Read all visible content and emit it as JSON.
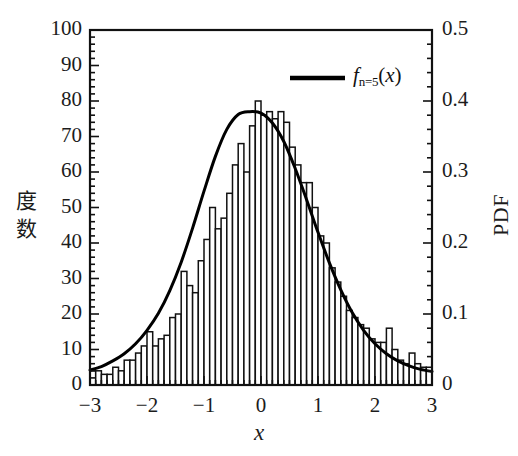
{
  "chart_data": {
    "type": "bar",
    "title": "",
    "subtitle": "",
    "xlabel": "x",
    "ylabel": "度 数",
    "ylabel_right": "PDF",
    "xlim": [
      -3,
      3
    ],
    "ylim": [
      0,
      100
    ],
    "ylim_right": [
      0,
      0.5
    ],
    "grid": false,
    "legend_position": "top-right",
    "xticks": [
      "−3",
      "−2",
      "−1",
      "0",
      "1",
      "2",
      "3"
    ],
    "xtick_values": [
      -3,
      -2,
      -1,
      0,
      1,
      2,
      3
    ],
    "yticks_left": [
      "0",
      "10",
      "20",
      "30",
      "40",
      "50",
      "60",
      "70",
      "80",
      "90",
      "100"
    ],
    "ytick_values_left": [
      0,
      10,
      20,
      30,
      40,
      50,
      60,
      70,
      80,
      90,
      100
    ],
    "yticks_right": [
      "0",
      "0.1",
      "0.2",
      "0.3",
      "0.4",
      "0.5"
    ],
    "ytick_values_right": [
      0,
      0.1,
      0.2,
      0.3,
      0.4,
      0.5
    ],
    "minor_ticks_per_major_x": 5,
    "minor_ticks_per_major_y": 5,
    "bin_width": 0.1,
    "bin_left_edges": [
      -3.0,
      -2.9,
      -2.8,
      -2.7,
      -2.6,
      -2.5,
      -2.4,
      -2.3,
      -2.2,
      -2.1,
      -2.0,
      -1.9,
      -1.8,
      -1.7,
      -1.6,
      -1.5,
      -1.4,
      -1.3,
      -1.2,
      -1.1,
      -1.0,
      -0.9,
      -0.8,
      -0.7,
      -0.6,
      -0.5,
      -0.4,
      -0.3,
      -0.2,
      -0.1,
      0.0,
      0.1,
      0.2,
      0.3,
      0.4,
      0.5,
      0.6,
      0.7,
      0.8,
      0.9,
      1.0,
      1.1,
      1.2,
      1.3,
      1.4,
      1.5,
      1.6,
      1.7,
      1.8,
      1.9,
      2.0,
      2.1,
      2.2,
      2.3,
      2.4,
      2.5,
      2.6,
      2.7,
      2.8,
      2.9
    ],
    "counts": [
      4,
      4,
      3,
      3,
      5,
      4,
      7,
      7,
      9,
      11,
      15,
      11,
      13,
      14,
      19,
      20,
      32,
      28,
      26,
      35,
      41,
      50,
      44,
      47,
      54,
      62,
      68,
      60,
      73,
      80,
      76,
      77,
      75,
      77,
      74,
      67,
      62,
      57,
      57,
      50,
      42,
      40,
      33,
      29,
      25,
      21,
      19,
      17,
      16,
      13,
      12,
      12,
      16,
      10,
      7,
      6,
      9,
      6,
      5,
      5
    ],
    "series": [
      {
        "name": "f_{n=5}(x)",
        "type": "line",
        "axis": "right",
        "color": "#000000",
        "linewidth": 3,
        "description": "Probability density function, normal-like, peak 0.385 at x = -0.05",
        "x": [
          -3.0,
          -2.8,
          -2.6,
          -2.4,
          -2.2,
          -2.0,
          -1.8,
          -1.6,
          -1.4,
          -1.2,
          -1.0,
          -0.8,
          -0.6,
          -0.4,
          -0.2,
          0.0,
          0.2,
          0.4,
          0.6,
          0.8,
          1.0,
          1.2,
          1.4,
          1.6,
          1.8,
          2.0,
          2.2,
          2.4,
          2.6,
          2.8,
          3.0
        ],
        "y": [
          0.021,
          0.026,
          0.034,
          0.044,
          0.058,
          0.077,
          0.101,
          0.133,
          0.173,
          0.221,
          0.273,
          0.322,
          0.36,
          0.381,
          0.385,
          0.383,
          0.369,
          0.343,
          0.305,
          0.261,
          0.215,
          0.172,
          0.134,
          0.102,
          0.077,
          0.058,
          0.044,
          0.034,
          0.027,
          0.022,
          0.019
        ]
      }
    ],
    "legend": [
      {
        "label_main": "f",
        "label_sub": "n=5",
        "label_tail": "(x)",
        "marker": "line",
        "color": "#000000"
      }
    ]
  },
  "axes": {
    "left": {
      "label": "度 数",
      "label_chars": [
        "度",
        "数"
      ]
    },
    "right": {
      "label": "PDF"
    },
    "bottom": {
      "label": "x"
    }
  },
  "style": {
    "frame_color": "#111111",
    "bar_edge_color": "#111111",
    "bar_fill_color": "#ffffff",
    "curve_color": "#000000",
    "background": "#ffffff"
  }
}
